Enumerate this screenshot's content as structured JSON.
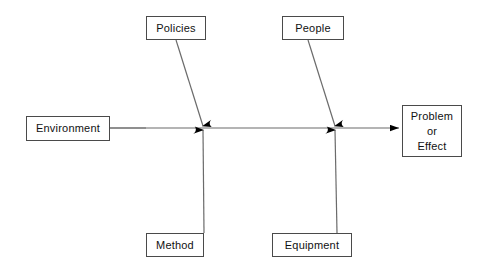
{
  "diagram": {
    "type": "fishbone-ishikawa",
    "title": "",
    "colors": {
      "stroke": "#4a4a4a",
      "spine": "#6b6b6b",
      "arrow_fill": "#000000",
      "background": "#ffffff",
      "text": "#111111"
    },
    "spine": {
      "start_x": 110,
      "end_x": 400,
      "y": 128,
      "arrowhead": "right-triangle"
    },
    "categories": [
      {
        "id": "policies",
        "label": "Policies",
        "position": "top-left",
        "box": {
          "x": 146,
          "y": 16,
          "w": 60,
          "h": 24
        },
        "bone": {
          "x1": 176,
          "y1": 40,
          "x2": 203,
          "y2": 128
        }
      },
      {
        "id": "people",
        "label": "People",
        "position": "top-right",
        "box": {
          "x": 282,
          "y": 16,
          "w": 62,
          "h": 24
        },
        "bone": {
          "x1": 308,
          "y1": 40,
          "x2": 335,
          "y2": 128
        }
      },
      {
        "id": "method",
        "label": "Method",
        "position": "bottom-left",
        "box": {
          "x": 146,
          "y": 233,
          "w": 58,
          "h": 24
        },
        "bone": {
          "x1": 204,
          "y1": 233,
          "x2": 203,
          "y2": 128
        }
      },
      {
        "id": "equipment",
        "label": "Equipment",
        "position": "bottom-right",
        "box": {
          "x": 272,
          "y": 233,
          "w": 80,
          "h": 24
        },
        "bone": {
          "x1": 337,
          "y1": 233,
          "x2": 335,
          "y2": 128
        }
      }
    ],
    "input_node": {
      "id": "environment",
      "label": "Environment",
      "box": {
        "x": 26,
        "y": 116,
        "w": 84,
        "h": 25
      }
    },
    "effect_node": {
      "id": "problem-or-effect",
      "label_line_1": "Problem",
      "label_line_2": "or",
      "label_line_3": "Effect",
      "box": {
        "x": 402,
        "y": 105,
        "w": 60,
        "h": 52
      }
    }
  }
}
